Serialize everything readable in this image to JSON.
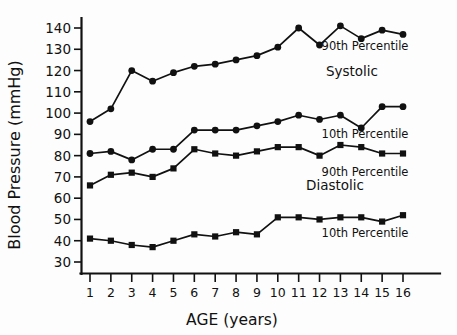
{
  "chart_data": {
    "type": "line",
    "title": "",
    "xlabel": "AGE (years)",
    "ylabel": "Blood Pressure (mmHg)",
    "x": [
      1,
      2,
      3,
      4,
      5,
      6,
      7,
      8,
      9,
      10,
      11,
      12,
      13,
      14,
      15,
      16
    ],
    "xtick_labels": [
      "1",
      "2",
      "3",
      "4",
      "5",
      "6",
      "7",
      "8",
      "9",
      "10",
      "11",
      "12",
      "13",
      "14",
      "15",
      "16"
    ],
    "ytick_labels": [
      "140",
      "130",
      "120",
      "110",
      "100",
      "90",
      "80",
      "70",
      "60",
      "50",
      "40",
      "30"
    ],
    "yticks": [
      140,
      130,
      120,
      110,
      100,
      90,
      80,
      70,
      60,
      50,
      40,
      30
    ],
    "xlim": [
      0.5,
      16.8
    ],
    "ylim": [
      25,
      145
    ],
    "grid": false,
    "legend_position": "inline-right",
    "marker": "filled-circle-and-square",
    "series": [
      {
        "name": "Systolic 90th Percentile",
        "group": "Systolic",
        "percentile": "90th Percentile",
        "marker": "circle",
        "values": [
          96,
          102,
          120,
          115,
          119,
          122,
          123,
          125,
          127,
          131,
          140,
          132,
          141,
          135,
          139,
          137
        ]
      },
      {
        "name": "Systolic 10th Percentile",
        "group": "Systolic",
        "percentile": "10th Percentile",
        "marker": "circle",
        "values": [
          81,
          82,
          78,
          83,
          83,
          92,
          92,
          92,
          94,
          96,
          99,
          97,
          99,
          93,
          103,
          103
        ]
      },
      {
        "name": "Diastolic 90th Percentile",
        "group": "Diastolic",
        "percentile": "90th Percentile",
        "marker": "square",
        "values": [
          66,
          71,
          72,
          70,
          74,
          83,
          81,
          80,
          82,
          84,
          84,
          80,
          85,
          84,
          81,
          81
        ]
      },
      {
        "name": "Diastolic 10th Percentile",
        "group": "Diastolic",
        "percentile": "10th Percentile",
        "marker": "square",
        "values": [
          41,
          40,
          38,
          37,
          40,
          43,
          42,
          44,
          43,
          51,
          51,
          50,
          51,
          51,
          49,
          52
        ]
      }
    ],
    "annotations": [
      {
        "name": "systolic-90th-label",
        "text": "90th Percentile",
        "x": 365,
        "y": 50
      },
      {
        "name": "systolic-group-label",
        "text": "Systolic",
        "x": 352,
        "y": 76
      },
      {
        "name": "systolic-10th-label",
        "text": "10th Percentile",
        "x": 365,
        "y": 138
      },
      {
        "name": "diastolic-90th-label",
        "text": "90th Percentile",
        "x": 365,
        "y": 176
      },
      {
        "name": "diastolic-group-label",
        "text": "Diastolic",
        "x": 335,
        "y": 190
      },
      {
        "name": "diastolic-10th-label",
        "text": "10th Percentile",
        "x": 365,
        "y": 237
      }
    ],
    "colors": {
      "line": "#111111",
      "marker": "#111111",
      "axis": "#111111",
      "background": "#fdfdfd"
    }
  }
}
